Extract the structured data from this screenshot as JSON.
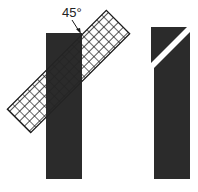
{
  "diagram": {
    "angle_label": "45°",
    "left_figure": {
      "description": "dark vertical bar overlaid with a grid-patterned strip rotated 45 degrees",
      "bar_color": "#2b2b2b",
      "grid_line_color": "#1a1a1a"
    },
    "right_figure": {
      "description": "dark vertical bar cut by a white diagonal line at 45 degrees",
      "bar_color": "#2b2b2b",
      "cut_color": "#ffffff"
    }
  }
}
